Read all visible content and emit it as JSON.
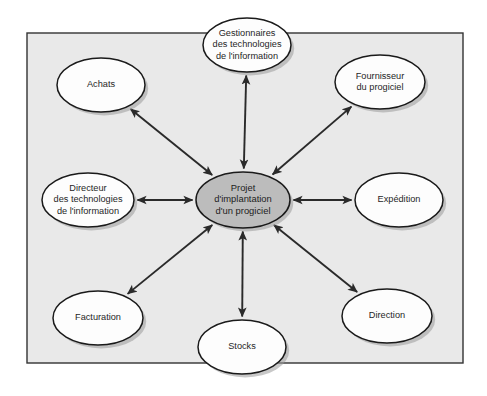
{
  "diagram": {
    "type": "stakeholder-map",
    "canvas": {
      "width": 487,
      "height": 396,
      "background": "#ffffff"
    },
    "frame": {
      "name": "outer-frame",
      "x": 27,
      "y": 33,
      "width": 436,
      "height": 330,
      "fill": "#e9e9e9",
      "stroke": "#333333"
    },
    "style": {
      "node_fill": "#fdfdfd",
      "center_fill": "#bcbcbc",
      "node_stroke": "#1a1a1a",
      "shadow": "#9a9a9a",
      "arrow_color": "#2a2a2a",
      "text_color": "#262626"
    },
    "center": {
      "id": "center",
      "name": "projet-implantation-progiciel",
      "cx": 243,
      "cy": 200,
      "rx": 47,
      "ry": 28,
      "lines": [
        "Projet",
        "d'implantation",
        "d'un progiciel"
      ]
    },
    "nodes": [
      {
        "id": "gestionnaires-ti",
        "name": "gestionnaires-des-technologies-de-linformation",
        "cx": 247,
        "cy": 45,
        "rx": 44,
        "ry": 27,
        "lines": [
          "Gestionnaires",
          "des technologies",
          "de l'information"
        ],
        "angle_deg": 90
      },
      {
        "id": "fournisseur-progiciel",
        "name": "fournisseur-du-progiciel",
        "cx": 380,
        "cy": 82,
        "rx": 45,
        "ry": 27,
        "lines": [
          "Fournisseur",
          "du progiciel"
        ],
        "angle_deg": 45
      },
      {
        "id": "achats",
        "name": "achats",
        "cx": 101,
        "cy": 85,
        "rx": 44,
        "ry": 27,
        "lines": [
          "Achats"
        ],
        "angle_deg": 135
      },
      {
        "id": "directeur-ti",
        "name": "directeur-des-technologies-de-linformation",
        "cx": 88,
        "cy": 200,
        "rx": 46,
        "ry": 27,
        "lines": [
          "Directeur",
          "des technologies",
          "de l'information"
        ],
        "angle_deg": 180
      },
      {
        "id": "expedition",
        "name": "expedition",
        "cx": 399,
        "cy": 200,
        "rx": 44,
        "ry": 27,
        "lines": [
          "Expédition"
        ],
        "angle_deg": 0
      },
      {
        "id": "facturation",
        "name": "facturation",
        "cx": 98,
        "cy": 318,
        "rx": 45,
        "ry": 27,
        "lines": [
          "Facturation"
        ],
        "angle_deg": 225
      },
      {
        "id": "stocks",
        "name": "stocks",
        "cx": 242,
        "cy": 347,
        "rx": 44,
        "ry": 27,
        "lines": [
          "Stocks"
        ],
        "angle_deg": 270
      },
      {
        "id": "direction",
        "name": "direction",
        "cx": 387,
        "cy": 316,
        "rx": 45,
        "ry": 27,
        "lines": [
          "Direction"
        ],
        "angle_deg": 315
      }
    ],
    "connections": [
      {
        "name": "link-center-gestionnaires-ti",
        "from": "center",
        "to": "gestionnaires-ti",
        "arrow": "double"
      },
      {
        "name": "link-center-fournisseur-progiciel",
        "from": "center",
        "to": "fournisseur-progiciel",
        "arrow": "double"
      },
      {
        "name": "link-center-achats",
        "from": "center",
        "to": "achats",
        "arrow": "double"
      },
      {
        "name": "link-center-directeur-ti",
        "from": "center",
        "to": "directeur-ti",
        "arrow": "double"
      },
      {
        "name": "link-center-expedition",
        "from": "center",
        "to": "expedition",
        "arrow": "double"
      },
      {
        "name": "link-center-facturation",
        "from": "center",
        "to": "facturation",
        "arrow": "double"
      },
      {
        "name": "link-center-stocks",
        "from": "center",
        "to": "stocks",
        "arrow": "double"
      },
      {
        "name": "link-center-direction",
        "from": "center",
        "to": "direction",
        "arrow": "double"
      }
    ]
  }
}
